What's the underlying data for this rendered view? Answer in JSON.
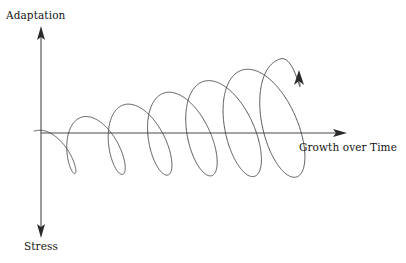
{
  "diagram": {
    "kind": "axis-diagram",
    "background_color": "#ffffff",
    "stroke_color": "#3a3a3a",
    "axis_color": "#4a4a4a",
    "text_color": "#141414",
    "labels": {
      "y_axis_top": "Adaptation",
      "y_axis_bottom": "Stress",
      "x_axis": "Growth over Time"
    },
    "axes": {
      "origin": {
        "x": 41,
        "y": 133
      },
      "vertical": {
        "name": "adaptation-stress-axis",
        "top": {
          "x": 41,
          "y": 30
        },
        "bottom": {
          "x": 41,
          "y": 234
        },
        "arrowheads": "both"
      },
      "horizontal": {
        "name": "growth-over-time-axis",
        "left": {
          "x": 41,
          "y": 133
        },
        "right": {
          "x": 346,
          "y": 133
        },
        "arrowheads": "right"
      }
    },
    "spiral": {
      "name": "growth-spiral",
      "description": "Expanding three-dimensional helix in perspective, coiling from lower-left to upper-right and terminating in an upward arrow",
      "loop_count": 6,
      "start_point": {
        "x": 41,
        "y": 168
      },
      "end_point": {
        "x": 299,
        "y": 76
      },
      "arrow_at_end": true,
      "tilt_degrees": -18,
      "amplitude_start": 22,
      "amplitude_end": 62,
      "center_line_start_y": 152,
      "center_line_end_y": 118
    }
  }
}
